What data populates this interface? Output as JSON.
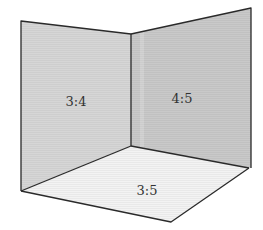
{
  "diagram": {
    "panels": [
      {
        "id": "left-wall",
        "label": "3:4",
        "fill": "#d6d6d6"
      },
      {
        "id": "right-wall",
        "label": "4:5",
        "fill": "#c9c9c9"
      },
      {
        "id": "floor",
        "label": "3:5",
        "fill": "#f3f3f3"
      }
    ],
    "colors": {
      "edge": "#2a2a2a",
      "background": "#ffffff"
    }
  }
}
